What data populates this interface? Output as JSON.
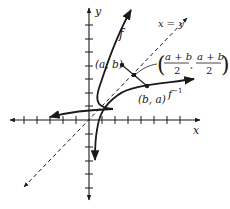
{
  "diagram": {
    "axes": {
      "x_label": "x",
      "y_label": "y"
    },
    "curves": {
      "f_label": "f",
      "f_inverse_label": "f",
      "f_inverse_superscript": "−1",
      "line_label": "x = y"
    },
    "points": {
      "point_ab": "(a, b)",
      "point_ba": "(b, a)",
      "midpoint_open": "(",
      "midpoint_num1": "a + b",
      "midpoint_den1": "2",
      "midpoint_comma": ",",
      "midpoint_num2": "a + b",
      "midpoint_den2": "2",
      "midpoint_close": ")"
    },
    "colors": {
      "ink": "#1a1a1a"
    }
  }
}
